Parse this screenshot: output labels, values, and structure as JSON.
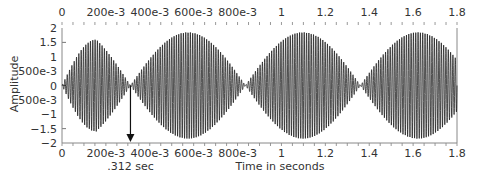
{
  "chart_data": {
    "type": "line",
    "title": "",
    "xlabel": "Time in seconds",
    "ylabel": "Amplitude",
    "xlim": [
      0,
      1.8
    ],
    "ylim": [
      -2,
      2
    ],
    "x_ticks": [
      0,
      0.2,
      0.4,
      0.6,
      0.8,
      1.0,
      1.2,
      1.4,
      1.6,
      1.8
    ],
    "x_tick_labels": [
      "0",
      "200e-3",
      "400e-3",
      "600e-3",
      "800e-3",
      "1",
      "1.2",
      "1.4",
      "1.6",
      "1.8"
    ],
    "y_ticks": [
      2,
      1.5,
      1,
      0.5,
      0,
      -0.5,
      -1,
      -1.5,
      -2
    ],
    "y_tick_labels": [
      "2",
      "1.5",
      "1",
      "500e-3",
      "0",
      "500e-3",
      "−1",
      "−1.5",
      "−2"
    ],
    "grid": false,
    "legend": null,
    "series": [
      {
        "name": "beating waveform",
        "description": "Amplitude-modulated (beat) signal: high-frequency carrier with sinusoidal envelope",
        "envelope_nodes_sec": [
          0,
          0.312,
          0.836,
          1.36
        ],
        "envelope_peaks": [
          {
            "t": 0.156,
            "amplitude": 1.6
          },
          {
            "t": 0.574,
            "amplitude": 1.85
          },
          {
            "t": 1.098,
            "amplitude": 1.85
          },
          {
            "t": 1.622,
            "amplitude": 1.85
          }
        ],
        "beat_period_sec": 0.524,
        "carrier_cycles_visible": 170,
        "color": "#1a1a1a"
      }
    ],
    "annotations": [
      {
        "type": "arrow",
        "x": 0.312,
        "from_y": 0,
        "to_y": -2,
        "direction": "down",
        "label": ".312 sec"
      }
    ]
  }
}
